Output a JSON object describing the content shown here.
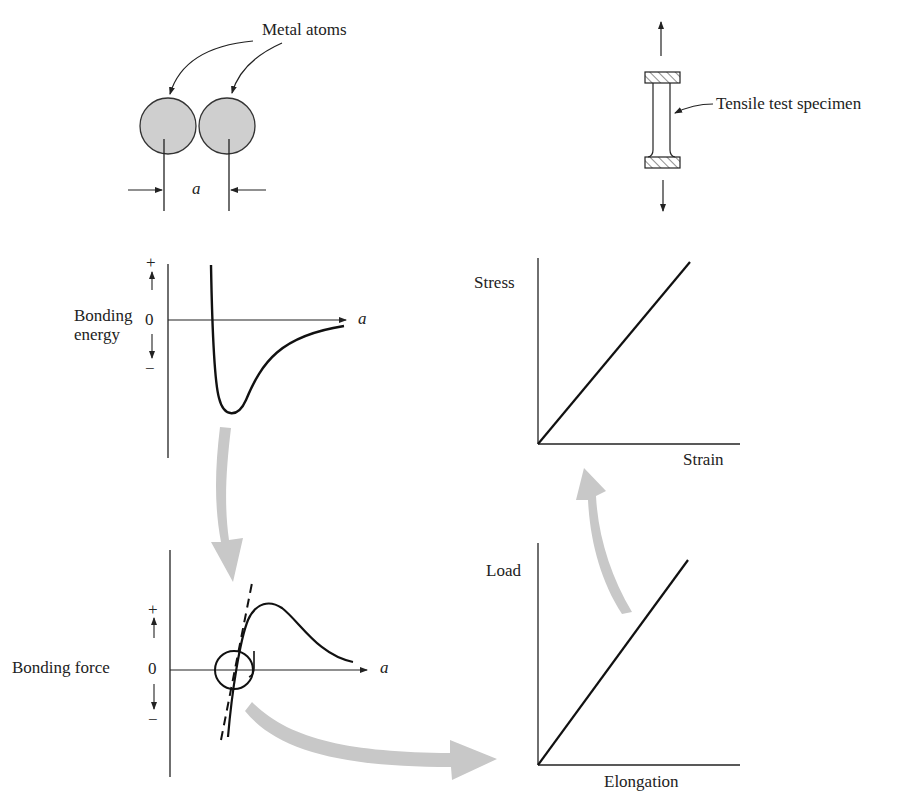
{
  "title_labels": {
    "metal_atoms": "Metal atoms",
    "spacing_symbol": "a",
    "tensile_specimen": "Tensile test specimen"
  },
  "energy_plot": {
    "ylabel_line1": "Bonding",
    "ylabel_line2": "energy",
    "plus": "+",
    "zero": "0",
    "minus": "−",
    "xlabel": "a"
  },
  "force_plot": {
    "ylabel": "Bonding force",
    "plus": "+",
    "zero": "0",
    "minus": "−",
    "xlabel": "a"
  },
  "stress_strain_plot": {
    "ylabel": "Stress",
    "xlabel": "Strain"
  },
  "load_elongation_plot": {
    "ylabel": "Load",
    "xlabel": "Elongation"
  },
  "colors": {
    "line": "#222222",
    "atom_fill": "#cfcfcf",
    "flow_arrow": "#c8c8c8"
  }
}
